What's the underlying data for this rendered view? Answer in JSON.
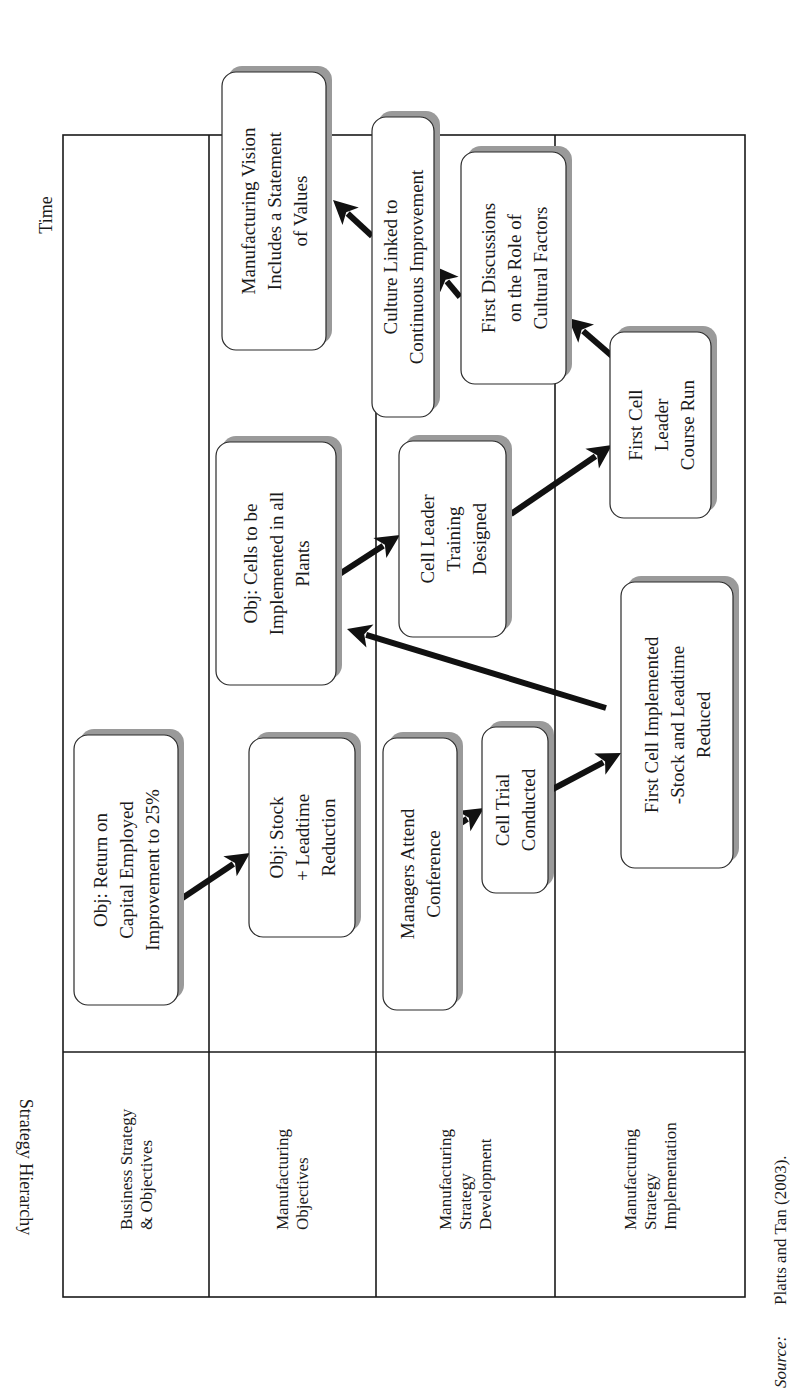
{
  "figure": {
    "orientation": "rotated-90-ccw",
    "time_axis_label": "Time",
    "hierarchy_axis_label": "Strategy Hierarchy",
    "source_label": "Source:",
    "source_text": "Platts and Tan (2003)."
  },
  "lanes": [
    {
      "id": "business",
      "label_lines": [
        "Business Strategy",
        "& Objectives"
      ]
    },
    {
      "id": "mfg-objectives",
      "label_lines": [
        "Manufacturing",
        "Objectives"
      ]
    },
    {
      "id": "mfg-development",
      "label_lines": [
        "Manufacturing",
        "Strategy",
        "Development"
      ]
    },
    {
      "id": "mfg-implementation",
      "label_lines": [
        "Manufacturing",
        "Strategy",
        "Implementation"
      ]
    }
  ],
  "nodes": [
    {
      "id": "roce",
      "lane": "business",
      "lines": [
        "Obj: Return on",
        "Capital Employed",
        "Improvement to 25%"
      ]
    },
    {
      "id": "stock-leadtime-obj",
      "lane": "mfg-objectives",
      "lines": [
        "Obj: Stock",
        "+ Leadtime",
        "Reduction"
      ]
    },
    {
      "id": "managers-conference",
      "lane": "mfg-development",
      "lines": [
        "Managers Attend",
        "Conference"
      ]
    },
    {
      "id": "cell-trial",
      "lane": "mfg-development",
      "lines": [
        "Cell Trial",
        "Conducted"
      ]
    },
    {
      "id": "first-cell-implemented",
      "lane": "mfg-implementation",
      "lines": [
        "First Cell Implemented",
        "-Stock and Leadtime",
        "Reduced"
      ]
    },
    {
      "id": "cells-all-plants",
      "lane": "mfg-objectives",
      "lines": [
        "Obj: Cells to be",
        "Implemented in all",
        "Plants"
      ]
    },
    {
      "id": "cell-leader-training",
      "lane": "mfg-development",
      "lines": [
        "Cell Leader",
        "Training",
        "Designed"
      ]
    },
    {
      "id": "first-cell-leader-course",
      "lane": "mfg-implementation",
      "lines": [
        "First Cell",
        "Leader",
        "Course Run"
      ]
    },
    {
      "id": "first-discussions-culture",
      "lane": "mfg-development",
      "lines": [
        "First Discussions",
        "on the Role of",
        "Cultural Factors"
      ]
    },
    {
      "id": "culture-continuous-improvement",
      "lane": "mfg-objectives/mfg-development",
      "lines": [
        "Culture Linked to",
        "Continuous Improvement"
      ]
    },
    {
      "id": "mfg-vision-values",
      "lane": "mfg-objectives",
      "lines": [
        "Manufacturing Vision",
        "Includes a Statement",
        "of Values"
      ]
    }
  ],
  "edges": [
    {
      "from": "roce",
      "to": "stock-leadtime-obj"
    },
    {
      "from": "managers-conference",
      "to": "cell-trial"
    },
    {
      "from": "cell-trial",
      "to": "first-cell-implemented"
    },
    {
      "from": "first-cell-implemented",
      "to": "cells-all-plants"
    },
    {
      "from": "cells-all-plants",
      "to": "cell-leader-training"
    },
    {
      "from": "cell-leader-training",
      "to": "first-cell-leader-course"
    },
    {
      "from": "first-cell-leader-course",
      "to": "first-discussions-culture"
    },
    {
      "from": "first-discussions-culture",
      "to": "culture-continuous-improvement"
    },
    {
      "from": "culture-continuous-improvement",
      "to": "mfg-vision-values"
    }
  ],
  "colors": {
    "line": "#1a1a1a",
    "box_fill": "#ffffff",
    "box_shadow": "#9a9a9a",
    "arrow": "#111111"
  }
}
